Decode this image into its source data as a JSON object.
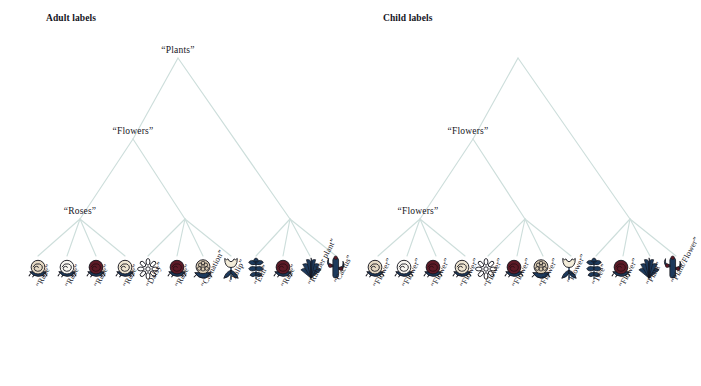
{
  "figure": {
    "panels": [
      {
        "id": "adult",
        "title": "Adult labels",
        "root": {
          "label": "“Plants”"
        },
        "internal_nodes": [
          {
            "label": "“Flowers”"
          },
          {
            "label": "“Roses”"
          },
          {
            "label": ""
          },
          {
            "label": ""
          }
        ],
        "groups": [
          {
            "parent_label": "“Roses”",
            "leaves": [
              {
                "label": "“Rose”",
                "icon": "rose-cream-icon"
              },
              {
                "label": "“Rose”",
                "icon": "rose-white-icon"
              },
              {
                "label": "“Rose”",
                "icon": "rose-dark-red-icon"
              },
              {
                "label": "“Rose”",
                "icon": "rose-pale-icon"
              }
            ]
          },
          {
            "parent_label": "",
            "leaves": [
              {
                "label": "“Daisy”",
                "icon": "daisy-icon"
              },
              {
                "label": "“Rose”",
                "icon": "rose-dark-red-icon"
              },
              {
                "label": "“Carnation”",
                "icon": "carnation-icon"
              },
              {
                "label": "“Tulip”",
                "icon": "tulip-icon"
              }
            ]
          },
          {
            "parent_label": "",
            "leaves": [
              {
                "label": "“Elm”",
                "icon": "elm-icon"
              },
              {
                "label": "“Rose”",
                "icon": "rose-dark-red-icon"
              },
              {
                "label": "“Rubber plant”",
                "icon": "rubber-plant-icon"
              },
              {
                "label": "“Cactus”",
                "icon": "cactus-icon"
              }
            ]
          }
        ]
      },
      {
        "id": "child",
        "title": "Child labels",
        "root": {
          "label": ""
        },
        "internal_nodes": [
          {
            "label": "“Flowers”"
          },
          {
            "label": "“Flowers”"
          },
          {
            "label": ""
          },
          {
            "label": ""
          }
        ],
        "groups": [
          {
            "parent_label": "“Flowers”",
            "leaves": [
              {
                "label": "“Flower”",
                "icon": "rose-cream-icon"
              },
              {
                "label": "“Flower”",
                "icon": "rose-white-icon"
              },
              {
                "label": "“Flower”",
                "icon": "rose-dark-red-icon"
              },
              {
                "label": "“Flower”",
                "icon": "rose-pale-icon"
              }
            ]
          },
          {
            "parent_label": "",
            "leaves": [
              {
                "label": "“Flower”",
                "icon": "daisy-icon"
              },
              {
                "label": "“Flower”",
                "icon": "rose-dark-red-icon"
              },
              {
                "label": "“Flower”",
                "icon": "carnation-icon"
              },
              {
                "label": "“Flower”",
                "icon": "tulip-icon"
              }
            ]
          },
          {
            "parent_label": "",
            "leaves": [
              {
                "label": "“Tree”",
                "icon": "elm-icon"
              },
              {
                "label": "“Flower”",
                "icon": "rose-dark-red-icon"
              },
              {
                "label": "“Plant”",
                "icon": "rubber-plant-icon"
              },
              {
                "label": "“Plant/Flower”",
                "icon": "cactus-icon"
              }
            ]
          }
        ]
      }
    ],
    "colors": {
      "branch": "#cddedb",
      "text": "#15151d",
      "background": "#ffffff",
      "dark_blue": "#1d3a5c",
      "dark_red": "#5c1a26",
      "cream": "#efe4cf",
      "white_petal": "#f7f5f0"
    }
  }
}
